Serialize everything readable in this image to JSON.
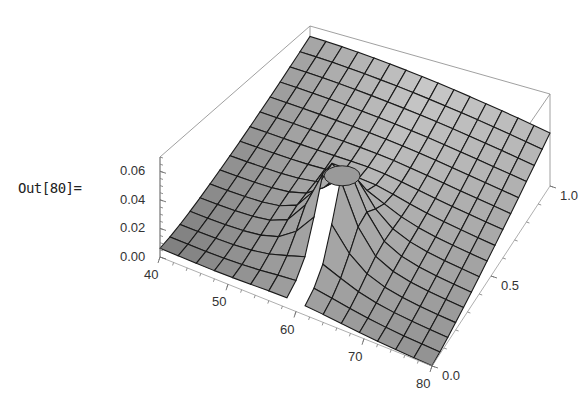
{
  "cell": {
    "output_label": "Out[80]="
  },
  "chart_data": {
    "type": "surface3d",
    "title": "",
    "x_axis": {
      "label": "",
      "range": [
        40,
        80
      ],
      "ticks": [
        "40",
        "50",
        "60",
        "70",
        "80"
      ]
    },
    "y_axis": {
      "label": "",
      "range": [
        0.0,
        1.0
      ],
      "ticks": [
        "0.0",
        "0.5",
        "1.0"
      ]
    },
    "z_axis": {
      "label": "",
      "range": [
        0.0,
        0.07
      ],
      "ticks": [
        "0.00",
        "0.02",
        "0.04",
        "0.06"
      ]
    },
    "surface": {
      "description": "Mesh surface rising toward y=1 (max about 0.06 at x≈40–55, y≈1), falling toward y=0; a sharp spike/pole near x≈60, y≈0.2–0.4 is clipped at top, leaving a hole",
      "mesh_lines": 15,
      "fill_color": "#a8a8a8",
      "mesh_color": "#1a1a1a"
    },
    "box": true,
    "grid": false,
    "legend": null
  }
}
